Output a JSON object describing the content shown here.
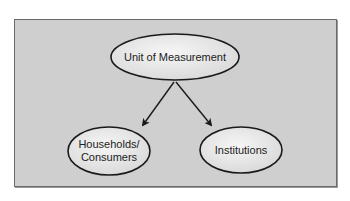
{
  "diagram": {
    "type": "hierarchy",
    "colors": {
      "panel": "#cfcfcf",
      "node_fill": "#eeeeee",
      "outline": "#1a1a1a"
    },
    "nodes": [
      {
        "id": "root",
        "label": "Unit of Measurement"
      },
      {
        "id": "left",
        "label_line1": "Households/",
        "label_line2": "Consumers"
      },
      {
        "id": "right",
        "label": "Institutions"
      }
    ],
    "edges": [
      {
        "from": "root",
        "to": "left"
      },
      {
        "from": "root",
        "to": "right"
      }
    ]
  }
}
